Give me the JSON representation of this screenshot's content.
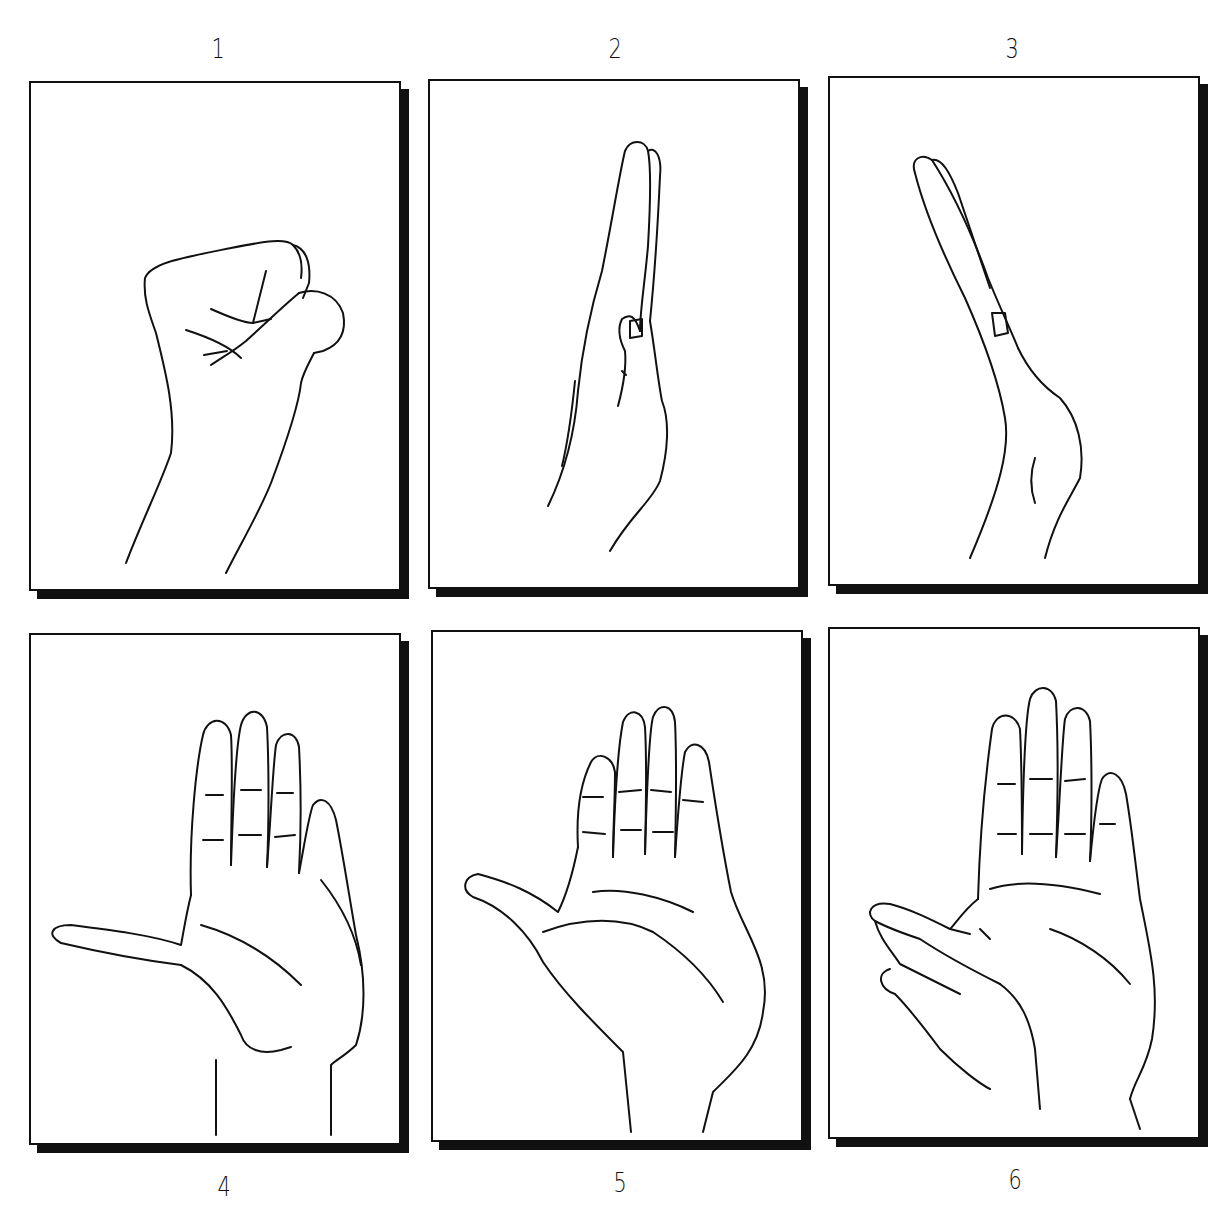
{
  "figure": {
    "panels": [
      {
        "label": "1",
        "pose": "closed fist, thumb wrapped over fingers"
      },
      {
        "label": "2",
        "pose": "hand flat on edge, fingers extended, thumb tucked alongside"
      },
      {
        "label": "3",
        "pose": "hand on edge, wrist bent with fingers extended"
      },
      {
        "label": "4",
        "pose": "open palm with thumb abducted fully outward"
      },
      {
        "label": "5",
        "pose": "open palm with thumb partially abducted"
      },
      {
        "label": "6",
        "pose": "open palm with other hand grasping and stretching thumb"
      }
    ],
    "colors": {
      "ink": "#111111",
      "background": "#ffffff",
      "shadow": "#111111"
    }
  }
}
